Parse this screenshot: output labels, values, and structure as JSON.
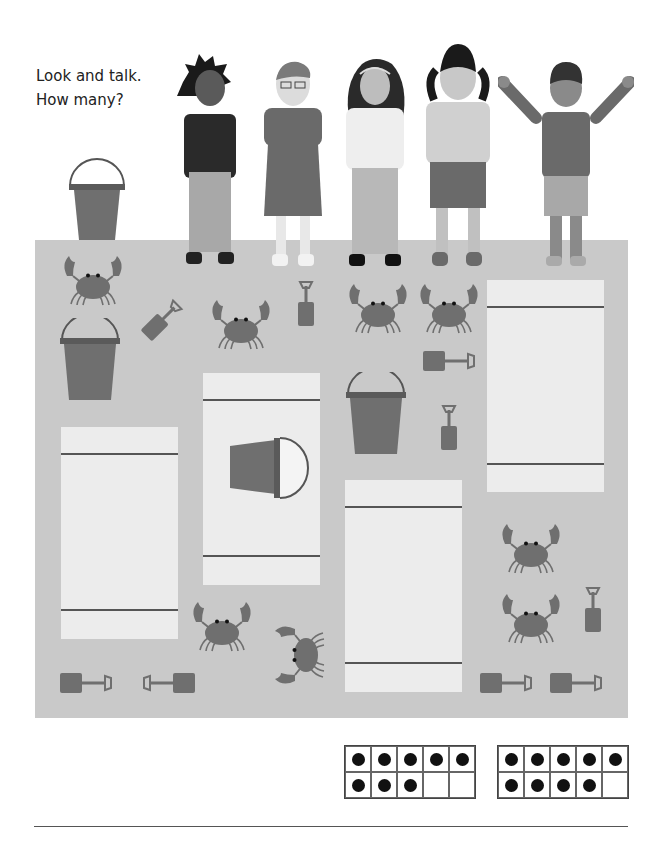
{
  "prompt": {
    "line1": "Look and talk.",
    "line2": "How many?"
  },
  "colors": {
    "sand": "#c9c9c9",
    "towel": "#ececec",
    "item": "#6f6f6f",
    "ink": "#222222"
  },
  "children": [
    {
      "name": "child-spiky-hair",
      "shirt": "#2a2a2a",
      "pants": "#a8a8a8",
      "skin": "#5a5a5a",
      "hair": "#1a1a1a"
    },
    {
      "name": "child-glasses",
      "shirt": "#6a6a6a",
      "pants": "#6a6a6a",
      "skin": "#dcdcdc",
      "hair": "#7a7a7a"
    },
    {
      "name": "child-curly-hair",
      "shirt": "#eeeeee",
      "pants": "#b8b8b8",
      "skin": "#bdbdbd",
      "hair": "#2a2a2a"
    },
    {
      "name": "child-pigtails",
      "shirt": "#d0d0d0",
      "pants": "#6a6a6a",
      "skin": "#c8c8c8",
      "hair": "#1a1a1a"
    },
    {
      "name": "child-waving",
      "shirt": "#6a6a6a",
      "pants": "#a8a8a8",
      "skin": "#8a8a8a",
      "hair": "#333333"
    }
  ],
  "items": {
    "crabs": 8,
    "buckets": 4,
    "spades": 9
  },
  "ten_frames": [
    {
      "filled": 8,
      "total": 10
    },
    {
      "filled": 9,
      "total": 10
    }
  ]
}
